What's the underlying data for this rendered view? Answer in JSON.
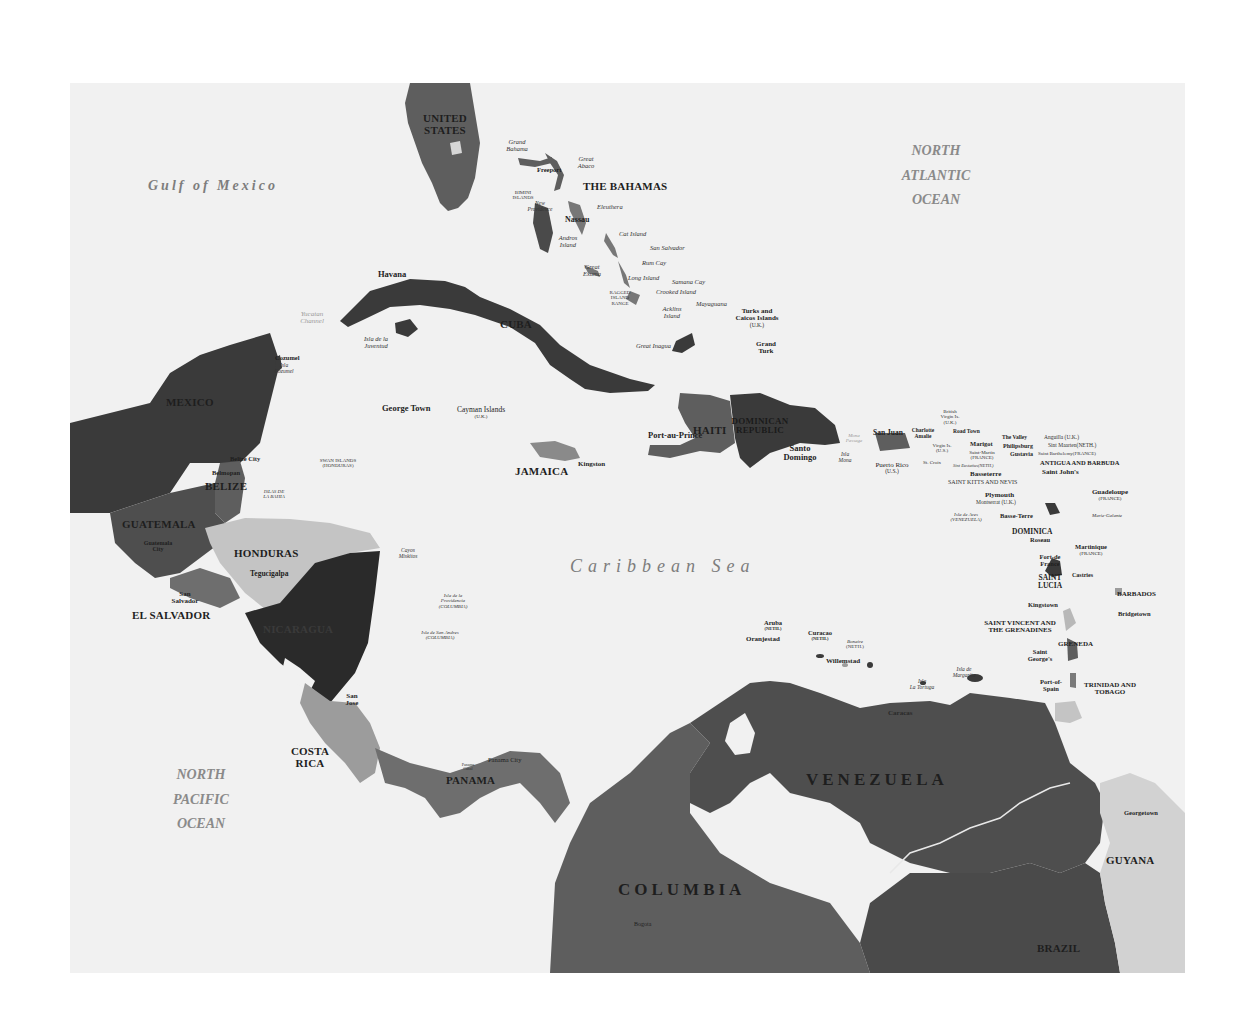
{
  "map": {
    "water_labels": {
      "gulf": "Gulf of Mexico",
      "atlantic": [
        "NORTH",
        "ATLANTIC",
        "OCEAN"
      ],
      "pacific": [
        "NORTH",
        "PACIFIC",
        "OCEAN"
      ],
      "caribbean": "Caribbean Sea",
      "yucatan_channel": [
        "Yucatan",
        "Channel"
      ],
      "mona_passage": [
        "Mona",
        "Passage"
      ]
    },
    "colors": {
      "water": "#f1f1f1",
      "dark": "#3a3a3a",
      "darker": "#2a2a2a",
      "mid": "#5e5e5e",
      "mid2": "#6e6e6e",
      "light": "#9c9c9c",
      "lighter": "#c4c4c4",
      "pale": "#d6d6d6"
    },
    "countries": {
      "usa": [
        "UNITED",
        "STATES"
      ],
      "bahamas": "THE BAHAMAS",
      "cuba": "CUBA",
      "mexico": "MEXICO",
      "belize": "BELIZE",
      "guatemala": "GUATEMALA",
      "honduras": "HONDURAS",
      "el_salvador": "EL SALVADOR",
      "nicaragua": "NICARAGUA",
      "costa_rica": [
        "COSTA",
        "RICA"
      ],
      "panama": "PANAMA",
      "jamaica": "JAMAICA",
      "haiti": "HAITI",
      "dominican_republic": [
        "DOMINICAN",
        "REPUBLIC"
      ],
      "venezuela": "VENEZUELA",
      "columbia": "COLUMBIA",
      "guyana": "GUYANA",
      "brazil": "BRAZIL",
      "antigua": "ANTIGUA AND BARBUDA",
      "st_kitts": "SAINT KITTS AND NEVIS",
      "dominica": "DOMINICA",
      "st_lucia": [
        "SAINT",
        "LUCIA"
      ],
      "st_vincent": [
        "SAINT VINCENT AND",
        "THE GRENADINES"
      ],
      "grenada": "GRENEDA",
      "barbados": "BARBADOS",
      "trinidad": [
        "TRINIDAD AND",
        "TOBAGO"
      ]
    },
    "capitals": {
      "havana": "Havana",
      "nassau": "Nassau",
      "freeport": "Freeport",
      "george_town": "George Town",
      "kingston_jm": "Kingston",
      "port_au_prince": "Port-au-Prince",
      "santo_domingo": [
        "Santo",
        "Domingo"
      ],
      "san_juan": "San Juan",
      "charlotte_amalie": [
        "Charlotte",
        "Amalie"
      ],
      "road_town": "Road Town",
      "the_valley": "The Valley",
      "marigot": "Marigot",
      "philipsburg": "Philipsburg",
      "gustavia": "Gustavia",
      "saint_johns": "Saint John's",
      "basseterre": "Basseterre",
      "plymouth": "Plymouth",
      "basse_terre": "Basse-Terre",
      "roseau": "Roseau",
      "fort_de_france": [
        "Fort-de",
        "France"
      ],
      "castries": "Castries",
      "kingstown": "Kingstown",
      "bridgetown": "Bridgetown",
      "saint_georges": [
        "Saint",
        "George's"
      ],
      "port_of_spain": [
        "Port-of-",
        "Spain"
      ],
      "oranjestad": "Oranjestad",
      "willemstad": "Willemstad",
      "caracas": "Caracas",
      "belize_city": "Belize City",
      "belmopan": "Belmopan",
      "guatemala_city": [
        "Guatemala",
        "City"
      ],
      "tegucigalpa": "Tegucigalpa",
      "san_salvador": [
        "San",
        "Salvador"
      ],
      "managua": "Managua",
      "san_jose": [
        "San",
        "Jose"
      ],
      "panama_city": "Panama City",
      "georgetown": "Georgetown",
      "bogota": "Bogota",
      "grand_turk": [
        "Grand",
        "Turk"
      ],
      "cozumel": "Cozumel"
    },
    "islands": {
      "grand_bahama": [
        "Grand",
        "Bahama"
      ],
      "great_abaco": [
        "Great",
        "Abaco"
      ],
      "bimini": [
        "BIMINI",
        "ISLANDS"
      ],
      "new_providence": [
        "New",
        "Providence"
      ],
      "eleuthera": "Eleuthera",
      "andros": [
        "Andros",
        "Island"
      ],
      "cat_island": "Cat Island",
      "san_salvador": "San Salvador",
      "rum_cay": "Rum Cay",
      "great_exuma": [
        "Great",
        "Exuma"
      ],
      "long_island": "Long Island",
      "samana_cay": "Samana Cay",
      "ragged_island": [
        "RAGGED",
        "ISLAND",
        "RANGE"
      ],
      "crooked_island": "Crooked Island",
      "acklins": [
        "Acklins",
        "Island"
      ],
      "mayaguana": "Mayaguana",
      "great_inagua": "Great Inagua",
      "turks_caicos": [
        "Turks and",
        "Caicos Islands",
        "(U.K.)"
      ],
      "isla_juventud": [
        "Isla de la",
        "Juventud"
      ],
      "isla_cozumel": [
        "Isla",
        "Cozumel"
      ],
      "cayman": [
        "Cayman Islands",
        "(U.K.)"
      ],
      "swan_islands": [
        "SWAN ISLANDS",
        "(HONDURAS)"
      ],
      "islas_bahia": [
        "ISLAS DE",
        "LA BAHIA"
      ],
      "cayos_miskitos": [
        "Cayos",
        "Miskitos"
      ],
      "providencia": [
        "Isla de la",
        "Providencia",
        "(COLUMBIA)"
      ],
      "san_andres": [
        "Isla de San Andres",
        "(COLUMBIA)"
      ],
      "isla_mona": [
        "Isla",
        "Mona"
      ],
      "puerto_rico": [
        "Puerto Rico",
        "(U.S.)"
      ],
      "bvi": [
        "British",
        "Virgin Is.",
        "(U.K.)"
      ],
      "usvi": [
        "Virgin Is.",
        "(U.S.)"
      ],
      "st_croix": "St. Croix",
      "anguilla": "Anguilla (U.K.)",
      "sint_maarten": "Sint Maarten(NETH.)",
      "saint_martin": [
        "Saint-Martin",
        "(FRANCE)"
      ],
      "st_barth": "Saint Barthelemy(FRANCE)",
      "sint_eustatius": "Sint Eustatius(NETH.)",
      "montserrat": "Montserrat (U.K.)",
      "guadeloupe": [
        "Guadeloupe",
        "(FRANCE)"
      ],
      "marie_galante": "Marie-Galante",
      "isla_aves": [
        "Isla de Aves",
        "(VENEZUELA)"
      ],
      "martinique": [
        "Martinique",
        "(FRANCE)"
      ],
      "aruba": [
        "Aruba",
        "(NETH.)"
      ],
      "curacao": [
        "Curacao",
        "(NETH.)"
      ],
      "bonaire": [
        "Bonaire",
        "(NETH.)"
      ],
      "la_tortuga": [
        "Isla",
        "La Tortuga"
      ],
      "margarita": [
        "Isla de",
        "Margarita"
      ],
      "panama_canal": [
        "Panama",
        "Canal"
      ]
    }
  }
}
